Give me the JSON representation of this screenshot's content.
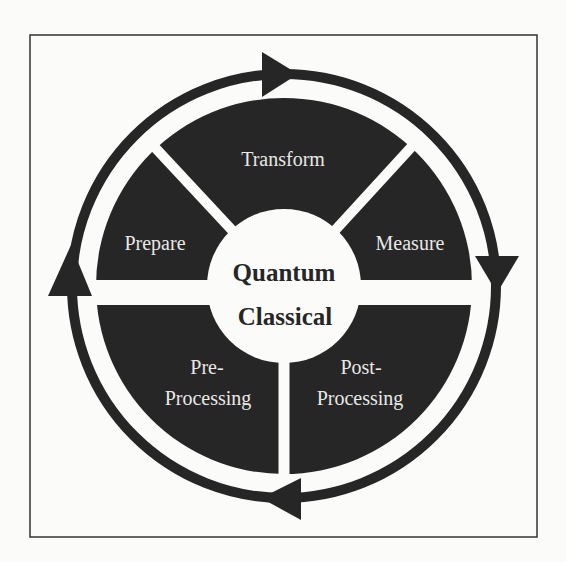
{
  "figure": {
    "type": "cycle-diagram",
    "frame": {
      "x": 30,
      "y": 35,
      "width": 507,
      "height": 502
    },
    "colors": {
      "background": "#fbfbfa",
      "segment_fill": "#262626",
      "separator": "#fbfbfa",
      "ring": "#262626",
      "segment_text": "#e9e9e7",
      "center_fill": "#fbfbfa",
      "center_text": "#262626"
    },
    "segments": [
      {
        "id": "transform",
        "label": "Transform",
        "position": "top"
      },
      {
        "id": "measure",
        "label": "Measure",
        "position": "upper-right"
      },
      {
        "id": "post-processing",
        "label_line1": "Post-",
        "label_line2": "Processing",
        "position": "lower-right"
      },
      {
        "id": "pre-processing",
        "label_line1": "Pre-",
        "label_line2": "Processing",
        "position": "lower-left"
      },
      {
        "id": "prepare",
        "label": "Prepare",
        "position": "upper-left"
      }
    ],
    "center": {
      "top_label": "Quantum",
      "bottom_label": "Classical"
    },
    "cycle_arrows": [
      {
        "position": "top",
        "direction": "clockwise"
      },
      {
        "position": "right",
        "direction": "clockwise"
      },
      {
        "position": "bottom",
        "direction": "clockwise"
      },
      {
        "position": "left",
        "direction": "clockwise"
      }
    ]
  }
}
